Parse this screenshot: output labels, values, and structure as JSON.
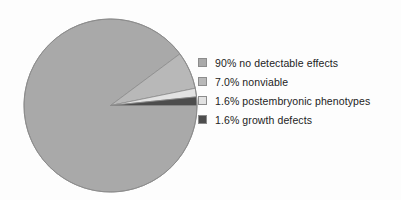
{
  "chart_data": {
    "type": "pie",
    "title": "",
    "subtitle": "",
    "xlabel": "",
    "ylabel": "",
    "grid": false,
    "legend_position": "right",
    "start_angle_deg": 0,
    "direction": "clockwise",
    "categories": [
      "no detectable effects",
      "nonviable",
      "postembryonic phenotypes",
      "growth defects"
    ],
    "values": [
      90.0,
      7.0,
      1.6,
      1.6
    ],
    "value_labels": [
      "90%",
      "7.0%",
      "1.6%",
      "1.6%"
    ],
    "colors": [
      "#a9a9a9",
      "#b8b8b8",
      "#e2e2e2",
      "#4d4d4d"
    ],
    "slices": [
      {
        "label": "no detectable effects",
        "value": 90.0,
        "value_label": "90%",
        "legend_text": "90% no detectable effects",
        "color": "#a9a9a9"
      },
      {
        "label": "nonviable",
        "value": 7.0,
        "value_label": "7.0%",
        "legend_text": "7.0% nonviable",
        "color": "#b8b8b8"
      },
      {
        "label": "postembryonic phenotypes",
        "value": 1.6,
        "value_label": "1.6%",
        "legend_text": "1.6% postembryonic phenotypes",
        "color": "#e2e2e2"
      },
      {
        "label": "growth defects",
        "value": 1.6,
        "value_label": "1.6%",
        "legend_text": "1.6% growth defects",
        "color": "#4d4d4d"
      }
    ]
  },
  "legend": {
    "items": [
      {
        "text": "90% no detectable effects",
        "color": "#a9a9a9"
      },
      {
        "text": "7.0% nonviable",
        "color": "#b8b8b8"
      },
      {
        "text": "1.6% postembryonic phenotypes",
        "color": "#e2e2e2"
      },
      {
        "text": "1.6% growth defects",
        "color": "#4d4d4d"
      }
    ]
  },
  "style": {
    "background": "#fdfdfd",
    "outline": "#8c8c8c",
    "text": "#232323"
  }
}
